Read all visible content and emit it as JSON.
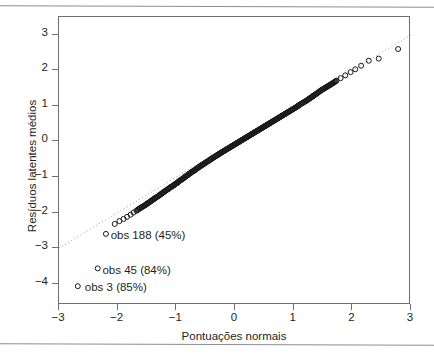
{
  "figure": {
    "title": "",
    "background_color": "#ffffff",
    "frame_color": "#6f6f72",
    "marker_color": "#1a1a1a",
    "refline_color": "#9a9a9d"
  },
  "axes": {
    "x": {
      "label": "Pontuações normais",
      "ticks": [
        -3,
        -2,
        -1,
        0,
        1,
        2,
        3
      ],
      "ticklabels": [
        "−3",
        "−2",
        "−1",
        "0",
        "1",
        "2",
        "3"
      ],
      "range": [
        -3,
        3
      ]
    },
    "y": {
      "label": "Resíduos latentes médios",
      "ticks": [
        3,
        2,
        1,
        0,
        -1,
        -2,
        -3,
        -4
      ],
      "ticklabels": [
        "3",
        "2",
        "1",
        "0",
        "−1",
        "−2",
        "−3",
        "−4"
      ],
      "range": [
        -4.6,
        3.5
      ]
    }
  },
  "annotations": [
    {
      "text": "obs 188 (45%)",
      "point_x": -2.2,
      "point_y": -2.6,
      "text_x": -2.12,
      "text_y": -2.66
    },
    {
      "text": "obs 45 (84%)",
      "point_x": -2.34,
      "point_y": -3.57,
      "text_x": -2.26,
      "text_y": -3.63
    },
    {
      "text": "obs 3 (85%)",
      "point_x": -2.68,
      "point_y": -4.07,
      "text_x": -2.56,
      "text_y": -4.13
    }
  ],
  "chart_data": {
    "type": "scatter",
    "title": "",
    "xlabel": "Pontuações normais",
    "ylabel": "Resíduos latentes médios",
    "xlim": [
      -3,
      3
    ],
    "ylim": [
      -4.6,
      3.5
    ],
    "grid": false,
    "legend": "none",
    "marker": "open-circle",
    "reference_line": {
      "type": "dotted",
      "x": [
        -3.0,
        3.0
      ],
      "y": [
        -3.0,
        3.0
      ],
      "description": "dotted 1:1 normal reference line"
    },
    "series": [
      {
        "name": "quantis amostrais",
        "x": [
          -2.68,
          -2.34,
          -2.2,
          -2.05,
          -1.97,
          -1.9,
          -1.84,
          -1.78,
          -1.73,
          -1.68,
          -1.64,
          -1.6,
          -1.56,
          -1.52,
          -1.49,
          -1.45,
          -1.42,
          -1.39,
          -1.36,
          -1.33,
          -1.3,
          -1.28,
          -1.25,
          -1.23,
          -1.2,
          -1.18,
          -1.15,
          -1.13,
          -1.11,
          -1.09,
          -1.06,
          -1.04,
          -1.02,
          -1.0,
          -0.98,
          -0.96,
          -0.95,
          -0.93,
          -0.91,
          -0.89,
          -0.87,
          -0.85,
          -0.84,
          -0.82,
          -0.8,
          -0.79,
          -0.77,
          -0.75,
          -0.74,
          -0.72,
          -0.7,
          -0.69,
          -0.67,
          -0.66,
          -0.64,
          -0.63,
          -0.61,
          -0.6,
          -0.58,
          -0.57,
          -0.55,
          -0.54,
          -0.52,
          -0.51,
          -0.5,
          -0.48,
          -0.47,
          -0.45,
          -0.44,
          -0.43,
          -0.41,
          -0.4,
          -0.39,
          -0.37,
          -0.36,
          -0.35,
          -0.33,
          -0.32,
          -0.31,
          -0.29,
          -0.28,
          -0.27,
          -0.26,
          -0.24,
          -0.23,
          -0.22,
          -0.2,
          -0.19,
          -0.18,
          -0.17,
          -0.15,
          -0.14,
          -0.13,
          -0.12,
          -0.1,
          -0.09,
          -0.08,
          -0.07,
          -0.05,
          -0.04,
          -0.03,
          -0.02,
          0.0,
          0.01,
          0.02,
          0.03,
          0.05,
          0.06,
          0.07,
          0.08,
          0.1,
          0.11,
          0.12,
          0.13,
          0.15,
          0.16,
          0.17,
          0.18,
          0.2,
          0.21,
          0.22,
          0.24,
          0.25,
          0.26,
          0.28,
          0.29,
          0.3,
          0.32,
          0.33,
          0.35,
          0.36,
          0.37,
          0.39,
          0.4,
          0.42,
          0.43,
          0.45,
          0.46,
          0.48,
          0.49,
          0.51,
          0.52,
          0.54,
          0.55,
          0.57,
          0.59,
          0.6,
          0.62,
          0.64,
          0.65,
          0.67,
          0.69,
          0.71,
          0.72,
          0.74,
          0.76,
          0.78,
          0.8,
          0.82,
          0.84,
          0.86,
          0.88,
          0.9,
          0.92,
          0.95,
          0.97,
          0.99,
          1.02,
          1.04,
          1.07,
          1.09,
          1.12,
          1.15,
          1.18,
          1.21,
          1.24,
          1.27,
          1.31,
          1.34,
          1.38,
          1.42,
          1.46,
          1.51,
          1.56,
          1.61,
          1.67,
          1.73,
          1.8,
          1.88,
          1.97,
          2.05,
          2.15,
          2.28,
          2.45,
          2.78
        ],
        "y": [
          -4.07,
          -3.57,
          -2.6,
          -2.32,
          -2.24,
          -2.18,
          -2.12,
          -2.06,
          -2.0,
          -1.95,
          -1.9,
          -1.86,
          -1.82,
          -1.78,
          -1.74,
          -1.7,
          -1.66,
          -1.63,
          -1.59,
          -1.56,
          -1.53,
          -1.5,
          -1.47,
          -1.44,
          -1.41,
          -1.38,
          -1.35,
          -1.33,
          -1.3,
          -1.28,
          -1.25,
          -1.23,
          -1.2,
          -1.18,
          -1.16,
          -1.13,
          -1.11,
          -1.09,
          -1.07,
          -1.05,
          -1.02,
          -1.0,
          -0.98,
          -0.96,
          -0.94,
          -0.92,
          -0.9,
          -0.88,
          -0.86,
          -0.84,
          -0.83,
          -0.81,
          -0.79,
          -0.77,
          -0.75,
          -0.74,
          -0.72,
          -0.7,
          -0.69,
          -0.67,
          -0.65,
          -0.64,
          -0.62,
          -0.61,
          -0.59,
          -0.58,
          -0.56,
          -0.55,
          -0.53,
          -0.52,
          -0.5,
          -0.49,
          -0.47,
          -0.46,
          -0.45,
          -0.43,
          -0.42,
          -0.4,
          -0.39,
          -0.38,
          -0.36,
          -0.35,
          -0.34,
          -0.32,
          -0.31,
          -0.3,
          -0.28,
          -0.27,
          -0.26,
          -0.25,
          -0.23,
          -0.22,
          -0.21,
          -0.2,
          -0.18,
          -0.17,
          -0.16,
          -0.15,
          -0.13,
          -0.12,
          -0.11,
          -0.1,
          -0.08,
          -0.07,
          -0.06,
          -0.05,
          -0.03,
          -0.02,
          -0.01,
          0.0,
          0.02,
          0.03,
          0.04,
          0.05,
          0.07,
          0.08,
          0.09,
          0.1,
          0.12,
          0.13,
          0.14,
          0.16,
          0.17,
          0.18,
          0.2,
          0.21,
          0.22,
          0.24,
          0.25,
          0.27,
          0.28,
          0.29,
          0.31,
          0.32,
          0.34,
          0.35,
          0.37,
          0.38,
          0.4,
          0.41,
          0.43,
          0.44,
          0.46,
          0.47,
          0.49,
          0.51,
          0.52,
          0.54,
          0.56,
          0.57,
          0.59,
          0.61,
          0.63,
          0.64,
          0.66,
          0.68,
          0.7,
          0.72,
          0.74,
          0.76,
          0.78,
          0.8,
          0.82,
          0.84,
          0.87,
          0.89,
          0.91,
          0.94,
          0.96,
          0.99,
          1.02,
          1.05,
          1.08,
          1.11,
          1.14,
          1.17,
          1.21,
          1.25,
          1.29,
          1.33,
          1.38,
          1.43,
          1.48,
          1.53,
          1.58,
          1.64,
          1.71,
          1.78,
          1.86,
          1.95,
          2.03,
          2.13,
          2.27,
          2.33,
          2.6
        ]
      }
    ],
    "annotated_points": [
      {
        "label": "obs 188 (45%)",
        "x": -2.2,
        "y": -2.6
      },
      {
        "label": "obs 45 (84%)",
        "x": -2.34,
        "y": -3.57
      },
      {
        "label": "obs 3 (85%)",
        "x": -2.68,
        "y": -4.07
      }
    ]
  }
}
